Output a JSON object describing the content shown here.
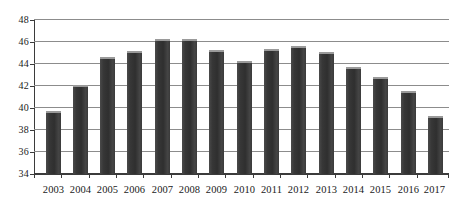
{
  "chart_data": {
    "type": "bar",
    "title": "",
    "subtitle": "",
    "xlabel": "",
    "ylabel": "",
    "categories": [
      "2003",
      "2004",
      "2005",
      "2006",
      "2007",
      "2008",
      "2009",
      "2010",
      "2011",
      "2012",
      "2013",
      "2014",
      "2015",
      "2016",
      "2017"
    ],
    "values": [
      39.7,
      42.0,
      44.6,
      45.1,
      46.2,
      46.2,
      45.2,
      44.2,
      45.3,
      45.6,
      45.0,
      43.7,
      42.8,
      41.5,
      39.2
    ],
    "series": [
      {
        "name": "",
        "values": [
          39.7,
          42.0,
          44.6,
          45.1,
          46.2,
          46.2,
          45.2,
          44.2,
          45.3,
          45.6,
          45.0,
          43.7,
          42.8,
          41.5,
          39.2
        ]
      }
    ],
    "ylim": [
      34,
      48
    ],
    "ytick_labels": [
      "34",
      "36",
      "38",
      "40",
      "42",
      "44",
      "46",
      "48"
    ],
    "ytick_values": [
      34,
      36,
      38,
      40,
      42,
      44,
      46,
      48
    ],
    "ytick_step": 2,
    "grid": true,
    "grid_axis": "y",
    "legend": false,
    "legend_position": "none",
    "annotations": [],
    "colors": {
      "bar_fill": "#3c3c3c",
      "bar_top_highlight": "#9a9a9a",
      "gridline": "#8c8c8c",
      "axis": "#3b3b3b",
      "text": "#1a1a1a",
      "background": "#ffffff"
    }
  }
}
